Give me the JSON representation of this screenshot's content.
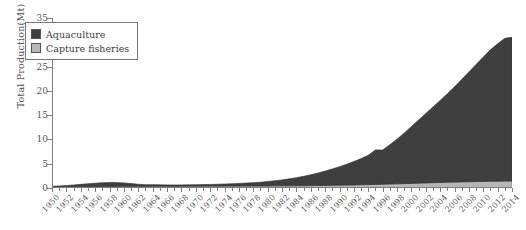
{
  "chart_data": {
    "type": "area",
    "stacked": true,
    "title": "",
    "xlabel": "",
    "ylabel": "Total Production(Mt)",
    "ylim": [
      0,
      35
    ],
    "xlim": [
      1950,
      2014
    ],
    "yticks": [
      0,
      5,
      10,
      15,
      20,
      25,
      30,
      35
    ],
    "grid": false,
    "legend_position": "upper-left",
    "x": [
      1950,
      1951,
      1952,
      1953,
      1954,
      1955,
      1956,
      1957,
      1958,
      1959,
      1960,
      1961,
      1962,
      1963,
      1964,
      1965,
      1966,
      1967,
      1968,
      1969,
      1970,
      1971,
      1972,
      1973,
      1974,
      1975,
      1976,
      1977,
      1978,
      1979,
      1980,
      1981,
      1982,
      1983,
      1984,
      1985,
      1986,
      1987,
      1988,
      1989,
      1990,
      1991,
      1992,
      1993,
      1994,
      1995,
      1996,
      1997,
      1998,
      1999,
      2000,
      2001,
      2002,
      2003,
      2004,
      2005,
      2006,
      2007,
      2008,
      2009,
      2010,
      2011,
      2012,
      2013,
      2014
    ],
    "xtick_labels": [
      "1950",
      "1952",
      "1954",
      "1956",
      "1958",
      "1960",
      "1962",
      "1964",
      "1966",
      "1968",
      "1970",
      "1972",
      "1974",
      "1976",
      "1978",
      "1980",
      "1982",
      "1984",
      "1986",
      "1988",
      "1990",
      "1992",
      "1994",
      "1996",
      "1998",
      "2000",
      "2002",
      "2004",
      "2006",
      "2008",
      "2010",
      "2012",
      "2014"
    ],
    "series": [
      {
        "name": "Capture fisheries",
        "color": "#b6b6b6",
        "values": [
          0.25,
          0.26,
          0.27,
          0.28,
          0.29,
          0.3,
          0.31,
          0.32,
          0.33,
          0.34,
          0.34,
          0.34,
          0.34,
          0.34,
          0.35,
          0.35,
          0.36,
          0.36,
          0.37,
          0.37,
          0.38,
          0.38,
          0.39,
          0.39,
          0.4,
          0.4,
          0.41,
          0.41,
          0.42,
          0.42,
          0.43,
          0.44,
          0.45,
          0.46,
          0.47,
          0.48,
          0.5,
          0.52,
          0.54,
          0.56,
          0.58,
          0.6,
          0.63,
          0.66,
          0.7,
          0.74,
          0.78,
          0.82,
          0.86,
          0.9,
          0.95,
          1.0,
          1.05,
          1.1,
          1.14,
          1.18,
          1.22,
          1.26,
          1.3,
          1.33,
          1.36,
          1.38,
          1.4,
          1.42,
          1.44
        ]
      },
      {
        "name": "Aquaculture",
        "color": "#3f3f3f",
        "values": [
          0.1,
          0.16,
          0.24,
          0.34,
          0.46,
          0.58,
          0.68,
          0.76,
          0.8,
          0.78,
          0.7,
          0.58,
          0.44,
          0.34,
          0.34,
          0.3,
          0.28,
          0.27,
          0.27,
          0.28,
          0.3,
          0.32,
          0.35,
          0.38,
          0.42,
          0.47,
          0.53,
          0.6,
          0.68,
          0.78,
          0.9,
          1.05,
          1.22,
          1.42,
          1.66,
          1.92,
          2.22,
          2.56,
          2.94,
          3.36,
          3.82,
          4.3,
          4.82,
          5.4,
          6.05,
          7.1,
          7.05,
          8.1,
          9.2,
          10.4,
          11.7,
          13.0,
          14.3,
          15.6,
          16.9,
          18.2,
          19.6,
          21.1,
          22.6,
          24.1,
          25.6,
          27.1,
          28.3,
          29.4,
          29.6
        ]
      }
    ],
    "totals_note": "Stacked total reaches about 31 Mt in 2014"
  },
  "legend": {
    "items": [
      {
        "label": "Aquaculture",
        "color": "#3f3f3f"
      },
      {
        "label": "Capture fisheries",
        "color": "#b6b6b6"
      }
    ]
  },
  "caption": ""
}
